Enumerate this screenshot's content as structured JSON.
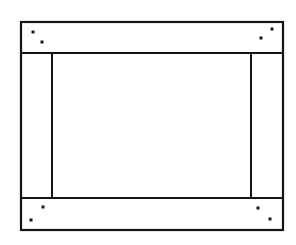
{
  "figure": {
    "kind": "line-drawing",
    "canvas": {
      "width": 296,
      "height": 245
    },
    "background_color": "#ffffff",
    "line_color": "#141414",
    "dot_color": "#161616"
  },
  "geometry": {
    "outer_frame": {
      "name": "outer-frame-rectangle",
      "x": 21,
      "y": 22,
      "width": 262,
      "height": 208,
      "stroke_width": 2.2
    },
    "rails": [
      {
        "name": "top-rail",
        "label": "top-rail",
        "divider_y": 53,
        "x1": 21,
        "x2": 283,
        "stroke_width": 2.2
      },
      {
        "name": "bottom-rail",
        "label": "bottom-rail",
        "divider_y": 198,
        "x1": 21,
        "x2": 283,
        "stroke_width": 2.2
      }
    ],
    "stiles": [
      {
        "name": "left-stile",
        "label": "left-stile",
        "divider_x": 52,
        "y1": 53,
        "y2": 198,
        "stroke_width": 2.0
      },
      {
        "name": "right-stile",
        "label": "right-stile",
        "divider_x": 251,
        "y1": 53,
        "y2": 198,
        "stroke_width": 2.0
      }
    ],
    "center_panel": {
      "name": "center-panel",
      "x": 52,
      "y": 53,
      "width": 199,
      "height": 145
    },
    "fastener_dots": [
      {
        "name": "dot-top-left-outer",
        "cx": 33,
        "cy": 32,
        "size": 3.0
      },
      {
        "name": "dot-top-left-inner",
        "cx": 42,
        "cy": 42,
        "size": 3.0
      },
      {
        "name": "dot-top-right-outer",
        "cx": 272,
        "cy": 29,
        "size": 3.0
      },
      {
        "name": "dot-top-right-inner",
        "cx": 261,
        "cy": 38,
        "size": 3.0
      },
      {
        "name": "dot-bottom-left-inner",
        "cx": 43,
        "cy": 207,
        "size": 3.0
      },
      {
        "name": "dot-bottom-left-outer",
        "cx": 31,
        "cy": 220,
        "size": 3.0
      },
      {
        "name": "dot-bottom-right-inner",
        "cx": 258,
        "cy": 208,
        "size": 3.0
      },
      {
        "name": "dot-bottom-right-outer",
        "cx": 270,
        "cy": 219,
        "size": 3.0
      }
    ]
  }
}
